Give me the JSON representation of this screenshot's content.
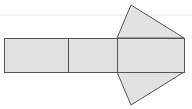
{
  "diagram": {
    "colors": {
      "background": "#ffffff",
      "fill": "#e2e2e2",
      "stroke": "#555555",
      "artifact_line": "#e6e6e6"
    },
    "artifact_line": {
      "x1": 0,
      "y1": 15,
      "x2": 192,
      "y2": 15
    },
    "rectangles": [
      {
        "id": "rect-1",
        "x": 4,
        "y": 38,
        "width": 64,
        "height": 34
      },
      {
        "id": "rect-2",
        "x": 68,
        "y": 38,
        "width": 49,
        "height": 34
      },
      {
        "id": "rect-3",
        "x": 117,
        "y": 38,
        "width": 67,
        "height": 34
      }
    ],
    "triangles": [
      {
        "id": "triangle-top",
        "points": "117,38 131,5 184,38"
      },
      {
        "id": "triangle-bottom",
        "points": "117,72 131,105 184,72"
      }
    ]
  }
}
